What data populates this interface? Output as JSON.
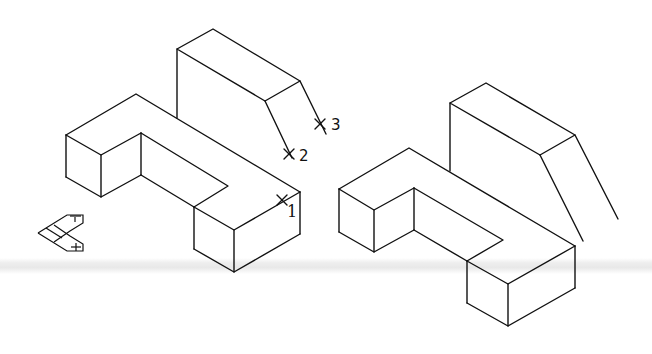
{
  "figure": {
    "background_color": "#ffffff",
    "line_color": "#111111"
  },
  "left_drawing": {
    "description": "Original object with pick points",
    "markers": [
      {
        "label": "1",
        "x": 282,
        "y": 200
      },
      {
        "label": "2",
        "x": 289,
        "y": 154
      },
      {
        "label": "3",
        "x": 320,
        "y": 124
      }
    ]
  },
  "right_drawing": {
    "description": "Resulting object after operation"
  },
  "ucs_icon": {
    "name": "ucs-icon",
    "x": 40,
    "y": 215
  }
}
